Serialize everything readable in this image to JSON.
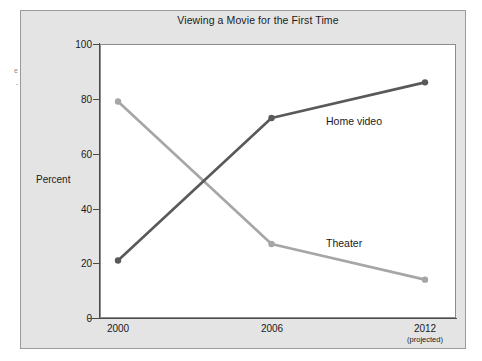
{
  "margin_notes": [
    "e",
    "-"
  ],
  "chart_data": {
    "type": "line",
    "title": "Viewing a Movie for the First Time",
    "xlabel": "",
    "ylabel": "Percent",
    "categories": [
      "2000",
      "2006",
      "2012"
    ],
    "category_sublabels": [
      "",
      "",
      "(projected)"
    ],
    "ylim": [
      0,
      100
    ],
    "yticks": [
      "0",
      "20",
      "40",
      "60",
      "80",
      "100"
    ],
    "grid": false,
    "legend_position": "inline-annotation",
    "series": [
      {
        "name": "Home video",
        "color": "#595959",
        "values": [
          21,
          73,
          86
        ],
        "label_text": "Home video"
      },
      {
        "name": "Theater",
        "color": "#a6a6a6",
        "values": [
          79,
          27,
          14
        ],
        "label_text": "Theater"
      }
    ]
  },
  "colors": {
    "page_background": "#ffffff",
    "figure_background": "#e4e4e4",
    "figure_border": "#9a9a9a",
    "plot_background": "#ffffff",
    "plot_border": "#8b8b8b",
    "axis": "#4a4a4a",
    "text": "#1b1b1b",
    "home_video": "#595959",
    "theater": "#a6a6a6"
  }
}
